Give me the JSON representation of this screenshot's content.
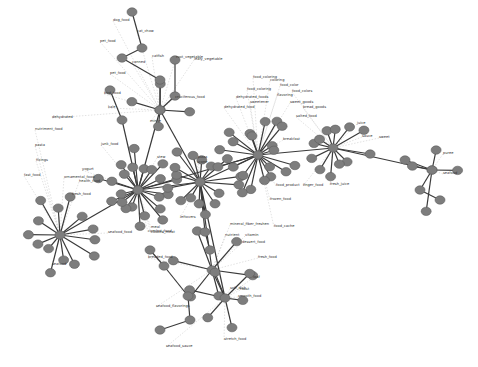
{
  "diagram": {
    "type": "network-graph",
    "title": "",
    "node_color": "#7d7d7d",
    "edge_color": "#3a3a3a",
    "background": "#ffffff",
    "hubs": [
      {
        "id": "food",
        "x": 138,
        "y": 190
      },
      {
        "id": "dish",
        "x": 200,
        "y": 182
      },
      {
        "id": "foodstuff",
        "x": 258,
        "y": 155
      },
      {
        "id": "fruit",
        "x": 333,
        "y": 148
      },
      {
        "id": "rice_dish",
        "x": 60,
        "y": 235
      },
      {
        "id": "bread",
        "x": 212,
        "y": 270
      },
      {
        "id": "meat",
        "x": 225,
        "y": 298
      },
      {
        "id": "crab",
        "x": 432,
        "y": 170
      },
      {
        "id": "vegetable",
        "x": 160,
        "y": 110
      }
    ],
    "labels": [
      {
        "text": "dog_food",
        "x": 113,
        "y": 21
      },
      {
        "text": "cat_chow",
        "x": 137,
        "y": 32
      },
      {
        "text": "pet_food",
        "x": 100,
        "y": 42
      },
      {
        "text": "catfish",
        "x": 152,
        "y": 57
      },
      {
        "text": "canned",
        "x": 132,
        "y": 63
      },
      {
        "text": "pet_food",
        "x": 110,
        "y": 74
      },
      {
        "text": "bird_food",
        "x": 104,
        "y": 94
      },
      {
        "text": "root_vegetable",
        "x": 176,
        "y": 58
      },
      {
        "text": "leafy_vegetable",
        "x": 194,
        "y": 60
      },
      {
        "text": "kale",
        "x": 108,
        "y": 108
      },
      {
        "text": "cruciferous_food",
        "x": 175,
        "y": 98
      },
      {
        "text": "dehydrated",
        "x": 52,
        "y": 118
      },
      {
        "text": "nutriment_food",
        "x": 35,
        "y": 130
      },
      {
        "text": "mince",
        "x": 150,
        "y": 122
      },
      {
        "text": "stew",
        "x": 157,
        "y": 158
      },
      {
        "text": "pasta",
        "x": 35,
        "y": 146
      },
      {
        "text": "fixings",
        "x": 36,
        "y": 161
      },
      {
        "text": "junk_food",
        "x": 101,
        "y": 145
      },
      {
        "text": "yogurt",
        "x": 82,
        "y": 170
      },
      {
        "text": "fast_food",
        "x": 24,
        "y": 176
      },
      {
        "text": "ornamental_food",
        "x": 64,
        "y": 178
      },
      {
        "text": "health_food",
        "x": 79,
        "y": 182
      },
      {
        "text": "fresh_food",
        "x": 72,
        "y": 195
      },
      {
        "text": "meal",
        "x": 151,
        "y": 228
      },
      {
        "text": "cooked_meat",
        "x": 151,
        "y": 233
      },
      {
        "text": "scone",
        "x": 197,
        "y": 163
      },
      {
        "text": "pizza",
        "x": 198,
        "y": 158
      },
      {
        "text": "leftovers",
        "x": 180,
        "y": 218
      },
      {
        "text": "comfort_food",
        "x": 148,
        "y": 232
      },
      {
        "text": "vitamin",
        "x": 245,
        "y": 236
      },
      {
        "text": "mineral_fiber_freshen",
        "x": 230,
        "y": 225
      },
      {
        "text": "food_cache",
        "x": 274,
        "y": 227
      },
      {
        "text": "nutrient",
        "x": 225,
        "y": 236
      },
      {
        "text": "fresh_food",
        "x": 258,
        "y": 258
      },
      {
        "text": "dessert_food",
        "x": 242,
        "y": 243
      },
      {
        "text": "soft_dish",
        "x": 230,
        "y": 289
      },
      {
        "text": "loaf",
        "x": 253,
        "y": 278
      },
      {
        "text": "roast",
        "x": 240,
        "y": 290
      },
      {
        "text": "breaded_food",
        "x": 148,
        "y": 258
      },
      {
        "text": "seafood",
        "x": 52,
        "y": 265
      },
      {
        "text": "seafood_food",
        "x": 108,
        "y": 233
      },
      {
        "text": "seafood_flavorings",
        "x": 156,
        "y": 307
      },
      {
        "text": "seafood_sauce",
        "x": 166,
        "y": 347
      },
      {
        "text": "stretch_food",
        "x": 224,
        "y": 340
      },
      {
        "text": "smooth_food",
        "x": 238,
        "y": 297
      },
      {
        "text": "food_coloring",
        "x": 253,
        "y": 78
      },
      {
        "text": "food_coloring",
        "x": 247,
        "y": 90
      },
      {
        "text": "coloring",
        "x": 270,
        "y": 81
      },
      {
        "text": "flavoring",
        "x": 277,
        "y": 96
      },
      {
        "text": "food_color",
        "x": 280,
        "y": 86
      },
      {
        "text": "food_colors",
        "x": 292,
        "y": 92
      },
      {
        "text": "dehydrated_foods",
        "x": 236,
        "y": 98
      },
      {
        "text": "dehydrated_food",
        "x": 224,
        "y": 108
      },
      {
        "text": "sweetener",
        "x": 250,
        "y": 103
      },
      {
        "text": "sweet_goods",
        "x": 290,
        "y": 103
      },
      {
        "text": "bread_goods",
        "x": 303,
        "y": 108
      },
      {
        "text": "salted_food",
        "x": 296,
        "y": 117
      },
      {
        "text": "breakfast",
        "x": 283,
        "y": 140
      },
      {
        "text": "food_product",
        "x": 276,
        "y": 186
      },
      {
        "text": "frozen_food",
        "x": 270,
        "y": 200
      },
      {
        "text": "finger_food",
        "x": 303,
        "y": 186
      },
      {
        "text": "juice",
        "x": 357,
        "y": 124
      },
      {
        "text": "sauce",
        "x": 362,
        "y": 137
      },
      {
        "text": "fresh_juice",
        "x": 330,
        "y": 185
      },
      {
        "text": "sweet",
        "x": 379,
        "y": 138
      },
      {
        "text": "puree",
        "x": 443,
        "y": 154
      },
      {
        "text": "seafood",
        "x": 443,
        "y": 174
      }
    ]
  }
}
